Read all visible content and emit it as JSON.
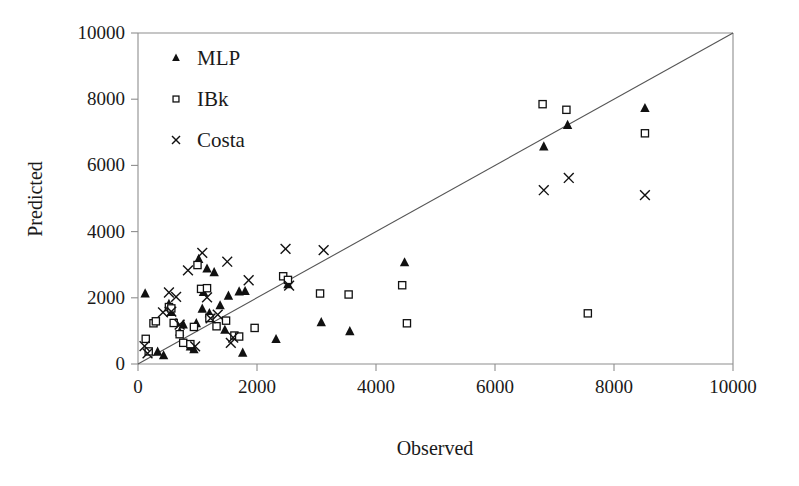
{
  "chart_data": {
    "type": "scatter",
    "title": "",
    "xlabel": "Observed",
    "ylabel": "Predicted",
    "xlim": [
      0,
      10000
    ],
    "ylim": [
      0,
      10000
    ],
    "xticks": [
      0,
      2000,
      4000,
      6000,
      8000,
      10000
    ],
    "yticks": [
      0,
      2000,
      4000,
      6000,
      8000,
      10000
    ],
    "xtick_labels": [
      "0",
      "2000",
      "4000",
      "6000",
      "8000",
      "10000"
    ],
    "ytick_labels": [
      "0",
      "2000",
      "4000",
      "6000",
      "8000",
      "10000"
    ],
    "grid": false,
    "legend_position": "upper-left",
    "reference_line": {
      "name": "identity-line",
      "from": [
        0,
        0
      ],
      "to": [
        10000,
        10000
      ]
    },
    "series": [
      {
        "name": "MLP",
        "marker": "filled-triangle",
        "color": "#111111",
        "points": [
          [
            120,
            2120
          ],
          [
            330,
            360
          ],
          [
            430,
            250
          ],
          [
            520,
            1800
          ],
          [
            560,
            1560
          ],
          [
            640,
            1240
          ],
          [
            700,
            960
          ],
          [
            760,
            1180
          ],
          [
            880,
            520
          ],
          [
            940,
            430
          ],
          [
            980,
            1220
          ],
          [
            1020,
            3160
          ],
          [
            1080,
            1660
          ],
          [
            1100,
            2160
          ],
          [
            1160,
            2870
          ],
          [
            1200,
            1520
          ],
          [
            1280,
            2760
          ],
          [
            1380,
            1760
          ],
          [
            1460,
            1020
          ],
          [
            1520,
            2050
          ],
          [
            1700,
            2180
          ],
          [
            1760,
            330
          ],
          [
            1800,
            2190
          ],
          [
            2320,
            740
          ],
          [
            2520,
            2400
          ],
          [
            3080,
            1250
          ],
          [
            3560,
            980
          ],
          [
            4480,
            3060
          ],
          [
            6820,
            6560
          ],
          [
            7220,
            7210
          ],
          [
            8520,
            7720
          ]
        ]
      },
      {
        "name": "IBk",
        "marker": "open-square",
        "color": "#111111",
        "points": [
          [
            130,
            760
          ],
          [
            180,
            380
          ],
          [
            260,
            1230
          ],
          [
            300,
            1290
          ],
          [
            520,
            1720
          ],
          [
            560,
            1680
          ],
          [
            600,
            1240
          ],
          [
            700,
            900
          ],
          [
            760,
            640
          ],
          [
            880,
            600
          ],
          [
            940,
            1120
          ],
          [
            1000,
            2990
          ],
          [
            1060,
            2270
          ],
          [
            1160,
            2290
          ],
          [
            1200,
            1390
          ],
          [
            1320,
            1140
          ],
          [
            1480,
            1310
          ],
          [
            1620,
            860
          ],
          [
            1700,
            830
          ],
          [
            1960,
            1090
          ],
          [
            2440,
            2650
          ],
          [
            2520,
            2540
          ],
          [
            3060,
            2130
          ],
          [
            3540,
            2100
          ],
          [
            4440,
            2380
          ],
          [
            4520,
            1230
          ],
          [
            6800,
            7850
          ],
          [
            7200,
            7680
          ],
          [
            7560,
            1530
          ],
          [
            8520,
            6970
          ]
        ]
      },
      {
        "name": "Costa",
        "marker": "cross-x",
        "color": "#111111",
        "points": [
          [
            110,
            540
          ],
          [
            160,
            320
          ],
          [
            420,
            1560
          ],
          [
            520,
            2160
          ],
          [
            560,
            1580
          ],
          [
            640,
            2030
          ],
          [
            700,
            1190
          ],
          [
            840,
            2830
          ],
          [
            960,
            530
          ],
          [
            1080,
            3360
          ],
          [
            1160,
            2010
          ],
          [
            1220,
            1380
          ],
          [
            1340,
            1490
          ],
          [
            1500,
            3090
          ],
          [
            1560,
            640
          ],
          [
            1600,
            800
          ],
          [
            1860,
            2530
          ],
          [
            2480,
            3480
          ],
          [
            2540,
            2370
          ],
          [
            3120,
            3440
          ],
          [
            6820,
            5250
          ],
          [
            7240,
            5620
          ],
          [
            8520,
            5100
          ]
        ]
      }
    ]
  },
  "legend": {
    "items": [
      {
        "label": "MLP",
        "marker": "filled-triangle"
      },
      {
        "label": "IBk",
        "marker": "open-square"
      },
      {
        "label": "Costa",
        "marker": "cross-x"
      }
    ]
  },
  "axes": {
    "x_title": "Observed",
    "y_title": "Predicted"
  }
}
